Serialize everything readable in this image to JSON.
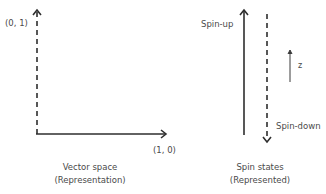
{
  "left_panel": {
    "y_axis_label": "(0, 1)",
    "x_axis_label": "(1, 0)",
    "caption_line1": "Vector space",
    "caption_line2": "(Representation)",
    "y_axis_style": "dashed",
    "x_axis_style": "solid"
  },
  "right_panel": {
    "spin_up_label": "Spin-up",
    "spin_down_label": "Spin-down",
    "axis_label": "z",
    "caption_line1": "Spin states",
    "caption_line2": "(Represented)",
    "spin_up_style": "solid",
    "spin_down_style": "dashed"
  },
  "colors": {
    "line": "#2e2e2e",
    "text": "#4a4a4a",
    "background": "#ffffff"
  }
}
